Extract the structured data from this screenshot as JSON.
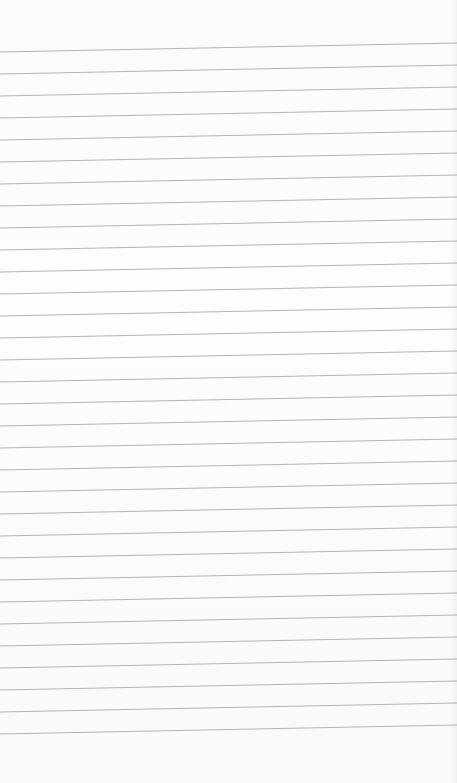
{
  "paper": {
    "type": "ruled notebook page",
    "background": "#fbfbfb",
    "line_color": "#b4b4b4",
    "line_count": 32,
    "first_line_left_y": 52,
    "first_line_right_y": 43,
    "line_spacing": 22.0,
    "width": 457,
    "height": 783
  }
}
